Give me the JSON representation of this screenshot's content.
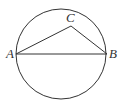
{
  "diagram": {
    "type": "geometry",
    "circle": {
      "cx": 61,
      "cy": 54,
      "r": 45
    },
    "points": {
      "A": {
        "label": "A",
        "x": 16,
        "y": 54
      },
      "B": {
        "label": "B",
        "x": 107,
        "y": 54
      },
      "C": {
        "label": "C",
        "x": 71,
        "y": 26
      }
    },
    "segments": [
      "AB",
      "AC",
      "CB"
    ],
    "stroke_color": "#333333"
  }
}
